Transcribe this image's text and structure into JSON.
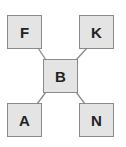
{
  "diagram": {
    "type": "tree",
    "colors": {
      "node_fill": "#e4e4e4",
      "node_border": "#8a8a8a",
      "edge": "#8a8a8a",
      "text": "#222222"
    },
    "nodes": [
      {
        "id": "F",
        "label": "F",
        "x": 7,
        "y": 15
      },
      {
        "id": "K",
        "label": "K",
        "x": 79,
        "y": 15
      },
      {
        "id": "B",
        "label": "B",
        "x": 43,
        "y": 59
      },
      {
        "id": "A",
        "label": "A",
        "x": 7,
        "y": 103
      },
      {
        "id": "N",
        "label": "N",
        "x": 79,
        "y": 103
      }
    ],
    "edges": [
      {
        "from": "B",
        "to": "F"
      },
      {
        "from": "B",
        "to": "K"
      },
      {
        "from": "B",
        "to": "A"
      },
      {
        "from": "B",
        "to": "N"
      }
    ]
  }
}
